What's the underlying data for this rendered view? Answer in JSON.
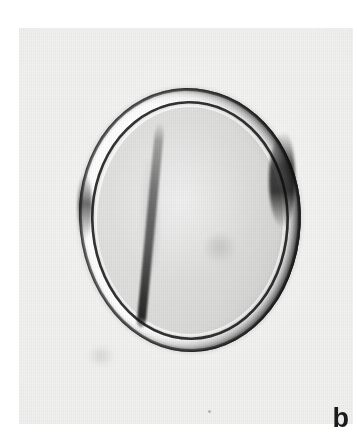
{
  "figure": {
    "kind": "photomicrograph",
    "panel_label": "b",
    "plate_background_color": "#f1f1f0",
    "page_background_color": "#ffffff",
    "label_color": "#1a1a1a"
  },
  "specimen": {
    "description": "pollen-grain",
    "outer_wall_color": "#181818",
    "inner_wall_color": "#202020",
    "wall_gap_color": "#ffffff",
    "protoplast_color": "#dedede",
    "furrow_color": "#141414"
  },
  "annotations": {
    "panel_label_text": "b"
  }
}
